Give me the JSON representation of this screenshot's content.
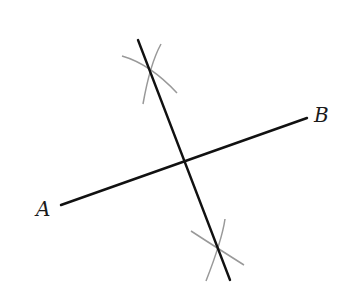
{
  "diagram": {
    "labels": {
      "point_a": "A",
      "point_b": "B"
    },
    "segment_ab": {
      "x1": 61,
      "y1": 205,
      "x2": 307,
      "y2": 118
    },
    "bisector": {
      "x1": 138,
      "y1": 40,
      "x2": 230,
      "y2": 280
    },
    "colors": {
      "line": "#111111",
      "arc": "#999999",
      "label": "#1a1a1a"
    }
  }
}
